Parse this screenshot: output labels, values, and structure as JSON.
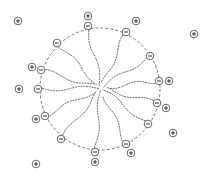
{
  "diagram": {
    "colors": {
      "stroke": "#555555",
      "tail": "#6a6a6a",
      "background": "#ffffff"
    },
    "micelle_boundary": {
      "cx": 100,
      "cy": 89,
      "rx": 60,
      "ry": 61,
      "style": "dashed"
    },
    "center": {
      "x": 101,
      "y": 88
    },
    "head_symbol": "−",
    "counterion_symbol": "+",
    "surfactant_heads": [
      {
        "x": 88,
        "y": 26
      },
      {
        "x": 126,
        "y": 32
      },
      {
        "x": 57,
        "y": 43
      },
      {
        "x": 150,
        "y": 56
      },
      {
        "x": 41,
        "y": 70
      },
      {
        "x": 159,
        "y": 81
      },
      {
        "x": 38,
        "y": 89
      },
      {
        "x": 157,
        "y": 103
      },
      {
        "x": 45,
        "y": 116
      },
      {
        "x": 148,
        "y": 124
      },
      {
        "x": 61,
        "y": 139
      },
      {
        "x": 126,
        "y": 144
      },
      {
        "x": 95,
        "y": 152
      }
    ],
    "counterions": [
      {
        "x": 88,
        "y": 16
      },
      {
        "x": 18,
        "y": 21
      },
      {
        "x": 136,
        "y": 21
      },
      {
        "x": 194,
        "y": 34
      },
      {
        "x": 32,
        "y": 67
      },
      {
        "x": 169,
        "y": 81
      },
      {
        "x": 19,
        "y": 89
      },
      {
        "x": 166,
        "y": 108
      },
      {
        "x": 36,
        "y": 119
      },
      {
        "x": 173,
        "y": 133
      },
      {
        "x": 131,
        "y": 153
      },
      {
        "x": 95,
        "y": 162
      },
      {
        "x": 36,
        "y": 164
      }
    ]
  }
}
